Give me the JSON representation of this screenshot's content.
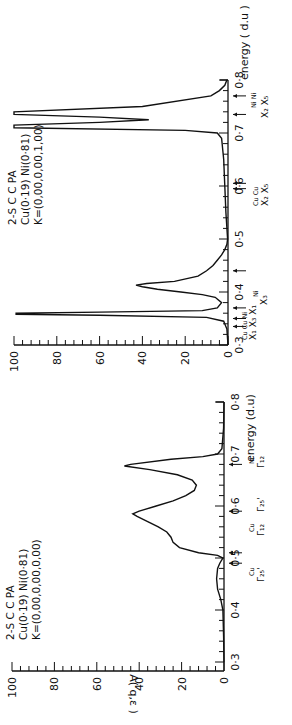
{
  "chart_data": [
    {
      "type": "line",
      "panel": "top",
      "orientation": "rotated 90deg counter-clockwise (energy axis vertical, increasing upward)",
      "annotation": [
        "2-S CCPA",
        "Cu(0·19) Ni(0·81)",
        "K=(0,00,0,00,1,00)"
      ],
      "xlabel": "energy (d.u)",
      "ylabel": "",
      "xlim": [
        0.3,
        0.8
      ],
      "ylim": [
        0,
        100
      ],
      "x_ticks": [
        "0·3",
        "0·4",
        "0·5",
        "0·6",
        "0·7",
        "0·8"
      ],
      "y_ticks": [
        "0",
        "20",
        "40",
        "60",
        "80",
        "100"
      ],
      "series": [
        {
          "name": "A(q,e)",
          "x": [
            0.3,
            0.33,
            0.345,
            0.352,
            0.356,
            0.358,
            0.36,
            0.362,
            0.365,
            0.37,
            0.38,
            0.39,
            0.395,
            0.4,
            0.405,
            0.41,
            0.413,
            0.416,
            0.42,
            0.43,
            0.44,
            0.45,
            0.46,
            0.47,
            0.48,
            0.49,
            0.5,
            0.55,
            0.6,
            0.65,
            0.69,
            0.7,
            0.705,
            0.71,
            0.715,
            0.72,
            0.725,
            0.73,
            0.735,
            0.74,
            0.75,
            0.77,
            0.78,
            0.79,
            0.8
          ],
          "values": [
            0,
            0.5,
            2,
            10,
            60,
            99,
            99,
            60,
            12,
            5,
            3,
            6,
            12,
            22,
            33,
            40,
            43,
            38,
            25,
            14,
            10,
            7,
            5,
            3,
            1.5,
            0.5,
            0.2,
            1,
            1.5,
            2,
            3,
            5,
            20,
            100,
            100,
            60,
            37,
            60,
            100,
            100,
            40,
            8,
            4,
            1.5,
            0.5
          ]
        }
      ],
      "markers": [
        {
          "label": "X1Cu",
          "energy": 0.335
        },
        {
          "label": "X3Cu",
          "energy": 0.35
        },
        {
          "label": "X1Ni",
          "energy": 0.37
        },
        {
          "label": "X3Ni",
          "energy": 0.44
        },
        {
          "label": "X2Cu",
          "energy": 0.595
        },
        {
          "label": "X5Cu",
          "energy": 0.605
        },
        {
          "label": "X2Ni",
          "energy": 0.735
        },
        {
          "label": "X5Ni",
          "energy": 0.77
        }
      ]
    },
    {
      "type": "line",
      "panel": "bottom",
      "orientation": "rotated 90deg counter-clockwise (energy axis vertical, increasing upward)",
      "annotation": [
        "2-S CCPA",
        "Cu(0·19) Ni(0·81)",
        "K=(0,00,0,00,0,00)"
      ],
      "xlabel": "energy (d.u)",
      "ylabel": "A(q,ε)",
      "xlim": [
        0.3,
        0.8
      ],
      "ylim": [
        0,
        100
      ],
      "x_ticks": [
        "0·3",
        "0·4",
        "0·5",
        "0·6",
        "0·7",
        "0·8"
      ],
      "y_ticks": [
        "0",
        "20",
        "40",
        "60",
        "80",
        "100"
      ],
      "series": [
        {
          "name": "A(q,ε)",
          "x": [
            0.3,
            0.35,
            0.4,
            0.42,
            0.44,
            0.46,
            0.48,
            0.49,
            0.5,
            0.505,
            0.51,
            0.52,
            0.53,
            0.54,
            0.55,
            0.56,
            0.57,
            0.58,
            0.585,
            0.59,
            0.6,
            0.61,
            0.62,
            0.63,
            0.64,
            0.65,
            0.66,
            0.67,
            0.677,
            0.68,
            0.69,
            0.695,
            0.7,
            0.71,
            0.75,
            0.8
          ],
          "values": [
            0,
            0.2,
            0.5,
            1.5,
            3,
            3.5,
            3,
            2,
            0.5,
            3,
            12,
            21,
            24,
            25,
            27,
            31,
            36,
            41,
            43,
            40,
            32,
            24,
            18,
            14,
            13,
            15,
            22,
            35,
            47,
            44,
            25,
            10,
            3,
            1,
            0.2,
            0
          ]
        }
      ],
      "markers": [
        {
          "label": "Γ25'Cu",
          "energy": 0.49
        },
        {
          "label": "Γ12Cu",
          "energy": 0.51
        },
        {
          "label": "Γ25'",
          "energy": 0.59
        },
        {
          "label": "Γ12Ni",
          "energy": 0.68
        }
      ]
    }
  ],
  "panels": {
    "top": {
      "title_lines": [
        "2-S C C PA",
        "Cu(0·19) Ni(0·81)",
        "K=(0,00,0,00,1,00)"
      ],
      "energy_label": "energy ( d.u )",
      "amp_ticks": [
        "100",
        "80",
        "60",
        "40",
        "20",
        "0"
      ],
      "energy_ticks": [
        "0·3",
        "0·4",
        "0·5",
        "0·6",
        "0·7",
        "0·8"
      ],
      "marker_labels": {
        "low": "X₁ X₃ X₁",
        "low_sup": "Cu Cu Ni",
        "x3ni": "X₃",
        "x3ni_sup": "Ni",
        "mid": "X₂ X₅",
        "mid_sup": "Cu Cu",
        "high": "X₂ X₅",
        "high_sup": "Ni Ni"
      }
    },
    "bottom": {
      "title_lines": [
        "2-S C C PA",
        "Cu(0·19) Ni(0·81)",
        "K=(0,00,0,00,0,00)"
      ],
      "energy_label": "energy (d.u)",
      "amp_label": "A( q,ε )",
      "amp_ticks": [
        "100",
        "80",
        "60",
        "40",
        "20",
        "0"
      ],
      "energy_ticks": [
        "0·3",
        "0·4",
        "0·5",
        "0·6",
        "0·7",
        "0·8"
      ],
      "marker_labels": {
        "g25cu": "Γ₂₅'",
        "g25cu_sup": "Cu",
        "g12cu": "Γ₁₂",
        "g12cu_sup": "Cu",
        "g25": "Γ₂₅'",
        "g12ni": "Γ₁₂",
        "g12ni_sup": "Ni"
      }
    }
  }
}
